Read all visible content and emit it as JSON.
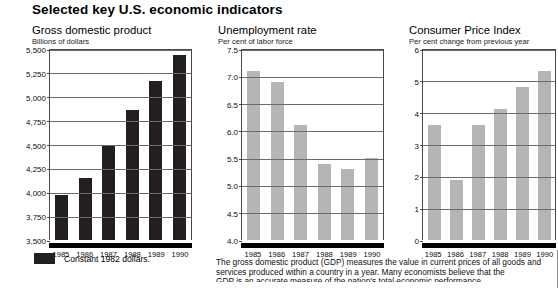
{
  "heading": "Selected key U.S. economic indicators",
  "legend": {
    "label": "Constant 1982 dollars.",
    "swatch_color": "#231f20"
  },
  "footnote": {
    "line1": "The gross domestic product (GDP) measures the value in current prices of all goods",
    "line2": "and services produced within a country in a year. Many economists believe that the",
    "line3": "GDP is an accurate measure of the nation's total economic performance."
  },
  "colors": {
    "bar_dark": "#231f20",
    "bar_grey": "#b5b5b5",
    "gridline": "#6b6b6b",
    "axis": "#4a4a4a"
  },
  "chart_data": [
    {
      "type": "bar",
      "title": "Gross domestic product",
      "subtitle": "Billions of dollars",
      "xlabel": "",
      "ylabel": "Billions of dollars",
      "categories": [
        "1985",
        "1986",
        "1987",
        "1988",
        "1989",
        "1990"
      ],
      "values": [
        3970,
        4150,
        4490,
        4860,
        5160,
        5440
      ],
      "ylim": [
        3500,
        5500
      ],
      "yticks": [
        3500,
        3750,
        4000,
        4250,
        4500,
        4750,
        5000,
        5250,
        5500
      ],
      "ytick_labels": [
        "3,500",
        "3,750",
        "4,000",
        "4,250",
        "4,500",
        "4,750",
        "5,000",
        "5,250",
        "5,500"
      ],
      "bar_color": "#231f20",
      "grid": true,
      "legend_position": "below"
    },
    {
      "type": "bar",
      "title": "Unemployment rate",
      "subtitle": "Per cent of labor force",
      "xlabel": "",
      "ylabel": "Per cent of labor force",
      "categories": [
        "1985",
        "1986",
        "1987",
        "1988",
        "1989",
        "1990"
      ],
      "values": [
        7.1,
        6.9,
        6.1,
        5.4,
        5.3,
        5.5
      ],
      "ylim": [
        4.0,
        7.5
      ],
      "yticks": [
        4.0,
        4.5,
        5.0,
        5.5,
        6.0,
        6.5,
        7.0,
        7.5
      ],
      "ytick_labels": [
        "4.0",
        "4.5",
        "5.0",
        "5.5",
        "6.0",
        "6.5",
        "7.0",
        "7.5"
      ],
      "bar_color": "#b5b5b5",
      "grid": true,
      "legend_position": "none"
    },
    {
      "type": "bar",
      "title": "Consumer Price Index",
      "subtitle": "Per cent change from previous year",
      "xlabel": "",
      "ylabel": "Per cent change from previous year",
      "categories": [
        "1985",
        "1986",
        "1987",
        "1988",
        "1989",
        "1990"
      ],
      "values": [
        3.6,
        1.9,
        3.6,
        4.1,
        4.8,
        5.3
      ],
      "ylim": [
        0,
        6
      ],
      "yticks": [
        0,
        1,
        2,
        3,
        4,
        5,
        6
      ],
      "ytick_labels": [
        "0",
        "1",
        "2",
        "3",
        "4",
        "5",
        "6"
      ],
      "bar_color": "#b5b5b5",
      "grid": true,
      "legend_position": "none"
    }
  ]
}
